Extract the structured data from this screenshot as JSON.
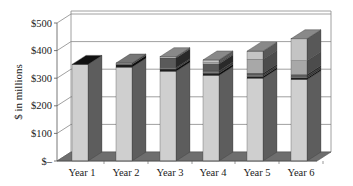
{
  "chart_data": {
    "type": "bar",
    "subtype": "stacked-3d",
    "title": "",
    "xlabel": "",
    "ylabel": "$ in millions",
    "ylim": [
      0,
      500
    ],
    "yticks": [
      "$–",
      "$100",
      "$200",
      "$300",
      "$400",
      "$500"
    ],
    "ytick_values": [
      0,
      100,
      200,
      300,
      400,
      500
    ],
    "grid": true,
    "legend": "none",
    "categories": [
      "Year 1",
      "Year 2",
      "Year 3",
      "Year 4",
      "Year 5",
      "Year 6"
    ],
    "series": [
      {
        "name": "Segment 1 (base)",
        "color": "#cfcfcf",
        "values": [
          350,
          340,
          325,
          310,
          300,
          295
        ]
      },
      {
        "name": "Segment 2",
        "color": "#1e1e1e",
        "values": [
          0,
          10,
          8,
          8,
          6,
          6
        ]
      },
      {
        "name": "Segment 3",
        "color": "#7a7a7a",
        "values": [
          0,
          0,
          5,
          8,
          6,
          6
        ]
      },
      {
        "name": "Segment 4",
        "color": "#5a5a5a",
        "values": [
          0,
          0,
          35,
          25,
          6,
          6
        ]
      },
      {
        "name": "Segment 5",
        "color": "#a8a8a8",
        "values": [
          0,
          5,
          0,
          5,
          50,
          50
        ]
      },
      {
        "name": "Segment 6",
        "color": "#c4c4c4",
        "values": [
          0,
          0,
          5,
          10,
          30,
          80
        ]
      }
    ],
    "totals": [
      350,
      355,
      378,
      366,
      398,
      443
    ]
  },
  "axis": {
    "ylabel": "$ in millions",
    "yticks": [
      "$500",
      "$400",
      "$300",
      "$200",
      "$100",
      "$–"
    ],
    "xticks": [
      "Year 1",
      "Year 2",
      "Year 3",
      "Year 4",
      "Year 5",
      "Year 6"
    ]
  }
}
